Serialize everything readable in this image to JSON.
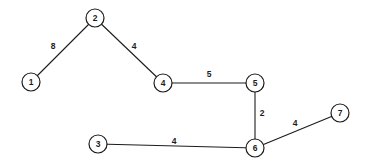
{
  "figure": {
    "width": 366,
    "height": 168,
    "background_color": "#ffffff",
    "stroke_color": "#1c1c1c",
    "text_color": "#1c1c1c",
    "node_radius": 9,
    "node_stroke_width": 1.2,
    "edge_stroke_width": 1.1,
    "nodes": [
      {
        "id": "1",
        "label": "1",
        "x": 31,
        "y": 82
      },
      {
        "id": "2",
        "label": "2",
        "x": 95,
        "y": 18
      },
      {
        "id": "3",
        "label": "3",
        "x": 98,
        "y": 144
      },
      {
        "id": "4",
        "label": "4",
        "x": 163,
        "y": 83
      },
      {
        "id": "5",
        "label": "5",
        "x": 255,
        "y": 83
      },
      {
        "id": "6",
        "label": "6",
        "x": 255,
        "y": 148
      },
      {
        "id": "7",
        "label": "7",
        "x": 340,
        "y": 113
      }
    ],
    "edges": [
      {
        "from": "1",
        "to": "2",
        "weight": "8",
        "label_x": 53,
        "label_y": 46
      },
      {
        "from": "2",
        "to": "4",
        "weight": "4",
        "label_x": 134,
        "label_y": 46
      },
      {
        "from": "4",
        "to": "5",
        "weight": "5",
        "label_x": 209,
        "label_y": 74
      },
      {
        "from": "5",
        "to": "6",
        "weight": "2",
        "label_x": 262,
        "label_y": 113
      },
      {
        "from": "6",
        "to": "7",
        "weight": "4",
        "label_x": 295,
        "label_y": 123
      },
      {
        "from": "3",
        "to": "6",
        "weight": "4",
        "label_x": 174,
        "label_y": 141
      }
    ]
  }
}
